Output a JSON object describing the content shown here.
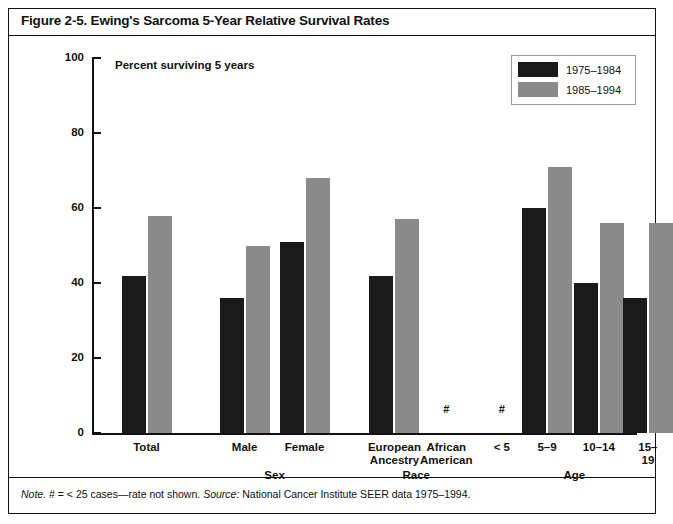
{
  "figure": {
    "title": "Figure 2-5. Ewing's Sarcoma 5-Year Relative Survival Rates",
    "subtitle": "Percent surviving 5 years",
    "note_prefix": "Note.",
    "note_body": " # = < 25 cases—rate not shown. ",
    "source_prefix": "Source:",
    "source_body": " National Cancer Institute SEER data 1975–1994."
  },
  "legend": {
    "position": "top-right",
    "entries": [
      {
        "label": "1975–1984",
        "color": "#1a1a1a"
      },
      {
        "label": "1985–1994",
        "color": "#8a8a8a"
      }
    ]
  },
  "axis": {
    "y_ticks": [
      0,
      20,
      40,
      60,
      80,
      100
    ],
    "y_min": 0,
    "y_max": 100
  },
  "group_labels": [
    {
      "text": "Sex",
      "center_pct": 0.335
    },
    {
      "text": "Race",
      "center_pct": 0.595
    },
    {
      "text": "Age",
      "center_pct": 0.885
    }
  ],
  "chart_data": {
    "type": "bar",
    "title": "Figure 2-5. Ewing's Sarcoma 5-Year Relative Survival Rates",
    "subtitle": "Percent surviving 5 years",
    "xlabel": "",
    "ylabel": "Percent surviving 5 years",
    "ylim": [
      0,
      100
    ],
    "yticks": [
      0,
      20,
      40,
      60,
      80,
      100
    ],
    "grid": false,
    "legend_position": "top-right",
    "categories": [
      "Total",
      "Male",
      "Female",
      "European Ancestry",
      "African American",
      "< 5",
      "5–9",
      "10–14",
      "15–19"
    ],
    "series": [
      {
        "name": "1975–1984",
        "color": "#1a1a1a",
        "values": [
          42,
          36,
          51,
          42,
          null,
          null,
          60,
          40,
          36
        ]
      },
      {
        "name": "1985–1994",
        "color": "#8a8a8a",
        "values": [
          58,
          50,
          68,
          57,
          null,
          null,
          71,
          56,
          56
        ]
      }
    ],
    "annotations": [
      {
        "text": "#",
        "category": "African American",
        "value": 2,
        "meaning": "< 25 cases—rate not shown"
      },
      {
        "text": "#",
        "category": "< 5",
        "value": 2,
        "meaning": "< 25 cases—rate not shown"
      }
    ]
  },
  "bars": [
    {
      "name": "Total",
      "label": "Total",
      "center_pct": 0.1,
      "dark": 42,
      "gray": 58,
      "hash": false
    },
    {
      "name": "Male",
      "label": "Male",
      "center_pct": 0.28,
      "dark": 36,
      "gray": 50,
      "hash": false
    },
    {
      "name": "Female",
      "label": "Female",
      "center_pct": 0.39,
      "dark": 51,
      "gray": 68,
      "hash": false
    },
    {
      "name": "European Ancestry",
      "label": "European\nAncestry",
      "center_pct": 0.555,
      "dark": 42,
      "gray": 57,
      "hash": false
    },
    {
      "name": "African American",
      "label": "African\nAmerican",
      "center_pct": 0.65,
      "dark": null,
      "gray": null,
      "hash": true
    },
    {
      "name": "Under 5",
      "label": "< 5",
      "center_pct": 0.752,
      "dark": null,
      "gray": null,
      "hash": true
    },
    {
      "name": "5-9",
      "label": "5–9",
      "center_pct": 0.835,
      "dark": 60,
      "gray": 71,
      "hash": false
    },
    {
      "name": "10-14",
      "label": "10–14",
      "center_pct": 0.93,
      "dark": 40,
      "gray": 56,
      "hash": false
    },
    {
      "name": "15-19",
      "label": "15–19",
      "center_pct": 1.02,
      "dark": 36,
      "gray": 56,
      "hash": false
    }
  ]
}
